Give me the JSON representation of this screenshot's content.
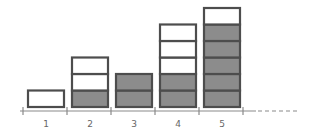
{
  "diagram": {
    "colors": {
      "border": "#4d4d4d",
      "filled": "#8c8c8c",
      "empty": "#ffffff",
      "axis": "#8a8a8a"
    },
    "columns": [
      {
        "label": "1",
        "filled": 0,
        "empty": 1
      },
      {
        "label": "2",
        "filled": 1,
        "empty": 2
      },
      {
        "label": "3",
        "filled": 2,
        "empty": 0
      },
      {
        "label": "4",
        "filled": 2,
        "empty": 3
      },
      {
        "label": "5",
        "filled": 5,
        "empty": 1
      }
    ],
    "axis_continues": true
  }
}
